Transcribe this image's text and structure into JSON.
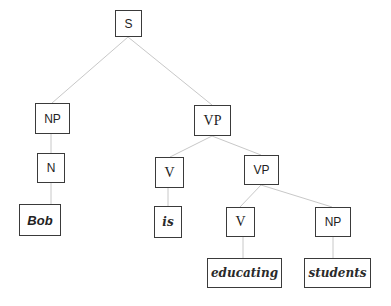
{
  "tree": {
    "nodes": {
      "S": {
        "label": "S"
      },
      "NP1": {
        "label": "NP"
      },
      "VP1": {
        "label": "VP"
      },
      "N": {
        "label": "N"
      },
      "V1": {
        "label": "V"
      },
      "VP2": {
        "label": "VP"
      },
      "Bob": {
        "label": "Bob"
      },
      "is": {
        "label": "is"
      },
      "V2": {
        "label": "V"
      },
      "NP2": {
        "label": "NP"
      },
      "educating": {
        "label": "educating"
      },
      "students": {
        "label": "students"
      }
    },
    "edges": [
      [
        "S",
        "NP1"
      ],
      [
        "S",
        "VP1"
      ],
      [
        "NP1",
        "N"
      ],
      [
        "N",
        "Bob"
      ],
      [
        "VP1",
        "V1"
      ],
      [
        "VP1",
        "VP2"
      ],
      [
        "V1",
        "is"
      ],
      [
        "VP2",
        "V2"
      ],
      [
        "VP2",
        "NP2"
      ],
      [
        "V2",
        "educating"
      ],
      [
        "NP2",
        "students"
      ]
    ],
    "colors": {
      "edge": "#c8c8c8",
      "border": "#3a3a3a",
      "text": "#222222"
    }
  }
}
